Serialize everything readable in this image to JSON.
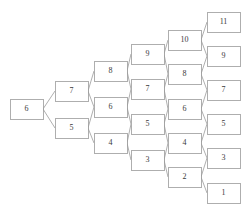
{
  "diagram": {
    "kind": "lattice",
    "canvas": {
      "width": 248,
      "height": 218,
      "background": "#ffffff"
    },
    "style": {
      "node_fill": "#ffffff",
      "node_stroke": "#9a9a9a",
      "edge_stroke": "#9a9a9a",
      "label_color": "#3a3a3a",
      "node_width": 33,
      "node_height": 20,
      "font_size": 8
    },
    "columns": [
      {
        "index": 0,
        "x": 10,
        "nodes": [
          {
            "id": "n0-0",
            "label": "6",
            "y": 99
          }
        ]
      },
      {
        "index": 1,
        "x": 55,
        "nodes": [
          {
            "id": "n1-0",
            "label": "7",
            "y": 81
          },
          {
            "id": "n1-1",
            "label": "5",
            "y": 118
          }
        ]
      },
      {
        "index": 2,
        "x": 94,
        "nodes": [
          {
            "id": "n2-0",
            "label": "8",
            "y": 61
          },
          {
            "id": "n2-1",
            "label": "6",
            "y": 97
          },
          {
            "id": "n2-2",
            "label": "4",
            "y": 133
          }
        ]
      },
      {
        "index": 3,
        "x": 131,
        "nodes": [
          {
            "id": "n3-0",
            "label": "9",
            "y": 44
          },
          {
            "id": "n3-1",
            "label": "7",
            "y": 79
          },
          {
            "id": "n3-2",
            "label": "5",
            "y": 114
          },
          {
            "id": "n3-3",
            "label": "3",
            "y": 150
          }
        ]
      },
      {
        "index": 4,
        "x": 168,
        "nodes": [
          {
            "id": "n4-0",
            "label": "10",
            "y": 30
          },
          {
            "id": "n4-1",
            "label": "8",
            "y": 64
          },
          {
            "id": "n4-2",
            "label": "6",
            "y": 99
          },
          {
            "id": "n4-3",
            "label": "4",
            "y": 133
          },
          {
            "id": "n4-4",
            "label": "2",
            "y": 167
          }
        ]
      },
      {
        "index": 5,
        "x": 207,
        "nodes": [
          {
            "id": "n5-0",
            "label": "11",
            "y": 12
          },
          {
            "id": "n5-1",
            "label": "9",
            "y": 46
          },
          {
            "id": "n5-2",
            "label": "7",
            "y": 80
          },
          {
            "id": "n5-3",
            "label": "5",
            "y": 114
          },
          {
            "id": "n5-4",
            "label": "3",
            "y": 148
          },
          {
            "id": "n5-5",
            "label": "1",
            "y": 183
          }
        ]
      }
    ],
    "edges": [
      {
        "from": "n0-0",
        "to": "n1-0"
      },
      {
        "from": "n0-0",
        "to": "n1-1"
      },
      {
        "from": "n1-0",
        "to": "n2-0"
      },
      {
        "from": "n1-0",
        "to": "n2-1"
      },
      {
        "from": "n1-1",
        "to": "n2-1"
      },
      {
        "from": "n1-1",
        "to": "n2-2"
      },
      {
        "from": "n2-0",
        "to": "n3-0"
      },
      {
        "from": "n2-0",
        "to": "n3-1"
      },
      {
        "from": "n2-1",
        "to": "n3-1"
      },
      {
        "from": "n2-1",
        "to": "n3-2"
      },
      {
        "from": "n2-2",
        "to": "n3-2"
      },
      {
        "from": "n2-2",
        "to": "n3-3"
      },
      {
        "from": "n3-0",
        "to": "n4-0"
      },
      {
        "from": "n3-0",
        "to": "n4-1"
      },
      {
        "from": "n3-1",
        "to": "n4-1"
      },
      {
        "from": "n3-1",
        "to": "n4-2"
      },
      {
        "from": "n3-2",
        "to": "n4-2"
      },
      {
        "from": "n3-2",
        "to": "n4-3"
      },
      {
        "from": "n3-3",
        "to": "n4-3"
      },
      {
        "from": "n3-3",
        "to": "n4-4"
      },
      {
        "from": "n4-0",
        "to": "n5-0"
      },
      {
        "from": "n4-0",
        "to": "n5-1"
      },
      {
        "from": "n4-1",
        "to": "n5-1"
      },
      {
        "from": "n4-1",
        "to": "n5-2"
      },
      {
        "from": "n4-2",
        "to": "n5-2"
      },
      {
        "from": "n4-2",
        "to": "n5-3"
      },
      {
        "from": "n4-3",
        "to": "n5-3"
      },
      {
        "from": "n4-3",
        "to": "n5-4"
      },
      {
        "from": "n4-4",
        "to": "n5-4"
      },
      {
        "from": "n4-4",
        "to": "n5-5"
      }
    ]
  }
}
